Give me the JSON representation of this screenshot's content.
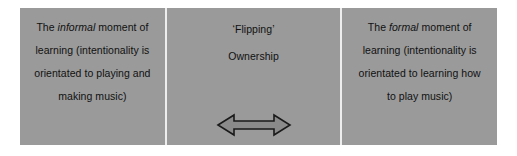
{
  "figure": {
    "type": "three-cell-diagram",
    "background_color": "#ffffff",
    "cell_fill_color": "#9a9a9a",
    "divider_color": "#ededed",
    "text_color": "#111111"
  },
  "cells": {
    "left": {
      "lines": [
        {
          "pre": "The ",
          "em": "informal",
          "post": " moment of"
        },
        {
          "pre": "learning (intentionality is",
          "em": "",
          "post": ""
        },
        {
          "pre": "orientated to playing and",
          "em": "",
          "post": ""
        },
        {
          "pre": "making music)",
          "em": "",
          "post": ""
        }
      ]
    },
    "middle": {
      "lines": [
        {
          "pre": "‘Flipping’",
          "em": "",
          "post": ""
        },
        {
          "pre": "Ownership",
          "em": "",
          "post": ""
        }
      ],
      "arrow": {
        "name": "double-headed-horizontal-arrow",
        "fill_color": "#8a8a8a",
        "stroke_color": "#1a1a1a"
      }
    },
    "right": {
      "lines": [
        {
          "pre": "The ",
          "em": "formal",
          "post": " moment of"
        },
        {
          "pre": "learning (intentionality is",
          "em": "",
          "post": ""
        },
        {
          "pre": "orientated to learning how",
          "em": "",
          "post": ""
        },
        {
          "pre": "to play music)",
          "em": "",
          "post": ""
        }
      ]
    }
  }
}
